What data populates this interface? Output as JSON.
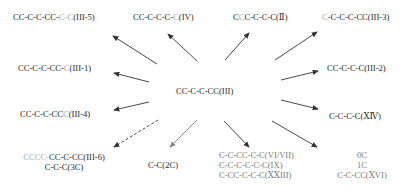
{
  "diagram": {
    "center": {
      "label": "CC-C-C-CC(III)"
    },
    "nodes": [
      {
        "id": "III-5",
        "parts": [
          {
            "t": "CC-C-C-CC-",
            "c": "d"
          },
          {
            "t": "C-C",
            "c": "g"
          },
          {
            "t": "(III-5)",
            "c": "d"
          }
        ]
      },
      {
        "id": "IV",
        "parts": [
          {
            "t": "CC-C-C-C-",
            "c": "d"
          },
          {
            "t": "C",
            "c": "g"
          },
          {
            "t": "(IV)",
            "c": "d"
          }
        ]
      },
      {
        "id": "II",
        "parts": [
          {
            "t": "C",
            "c": "d"
          },
          {
            "t": "C",
            "c": "g"
          },
          {
            "t": "C-C-C-C(Ⅱ)",
            "c": "d"
          }
        ]
      },
      {
        "id": "III-3",
        "parts": [
          {
            "t": "C",
            "c": "g"
          },
          {
            "t": "-C-C-C-CC(III-3)",
            "c": "d"
          }
        ]
      },
      {
        "id": "III-1",
        "parts": [
          {
            "t": "CC-C-C-CC-",
            "c": "d"
          },
          {
            "t": "C",
            "c": "g"
          },
          {
            "t": "(III-1)",
            "c": "d"
          }
        ]
      },
      {
        "id": "III-2",
        "parts": [
          {
            "t": "CC-C-C-C(III-2)",
            "c": "d"
          }
        ]
      },
      {
        "id": "III-4",
        "parts": [
          {
            "t": "CC-C-C-CC",
            "c": "d"
          },
          {
            "t": "C",
            "c": "g"
          },
          {
            "t": "(III-4)",
            "c": "d"
          }
        ]
      },
      {
        "id": "XIV",
        "parts": [
          {
            "t": "C-C-C-C(ⅩⅣ)",
            "c": "d"
          }
        ]
      },
      {
        "id": "III-6",
        "parts": [
          {
            "t": "CCC",
            "c": "g"
          },
          {
            "t": "C-",
            "c": "g"
          },
          {
            "t": "CC-C-CC(III-6)",
            "c": "d"
          }
        ],
        "sub": "C-C-C(3C)"
      },
      {
        "id": "2C",
        "parts": [
          {
            "t": "C-C(2C)",
            "c": "d"
          }
        ]
      },
      {
        "id": "VI-VII",
        "lines": [
          "C-C-CC-C-C(VI/VII)",
          "C-C-C-C-C-C(IX)",
          "C-CC-C-C-C(ⅩⅩIII)"
        ]
      },
      {
        "id": "XVI",
        "lines": [
          "0C",
          "1C",
          "C-C-CC(ⅩVI)"
        ]
      }
    ],
    "arrows": [
      {
        "to": "III-5",
        "style": "solid"
      },
      {
        "to": "IV",
        "style": "solid"
      },
      {
        "to": "II",
        "style": "solid"
      },
      {
        "to": "III-3",
        "style": "solid"
      },
      {
        "to": "III-1",
        "style": "solid"
      },
      {
        "to": "III-2",
        "style": "solid"
      },
      {
        "to": "III-4",
        "style": "solid"
      },
      {
        "to": "XIV",
        "style": "solid"
      },
      {
        "to": "III-6",
        "style": "dashed"
      },
      {
        "to": "2C",
        "style": "solid-gray"
      },
      {
        "to": "VI-VII",
        "style": "solid"
      },
      {
        "to": "XVI",
        "style": "solid"
      }
    ],
    "colors": {
      "text": "#2a2a2a",
      "faded": "#a8a8a8",
      "arrow": "#333333",
      "arrow_gray": "#888888"
    }
  }
}
